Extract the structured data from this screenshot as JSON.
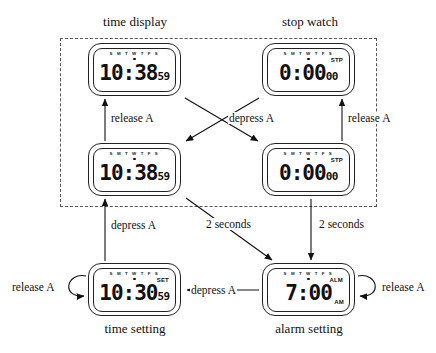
{
  "diagram": {
    "title_groups": [
      {
        "id": "time-display",
        "label": "time display"
      },
      {
        "id": "stop-watch",
        "label": "stop watch"
      }
    ],
    "bottom_captions": [
      {
        "id": "time-setting",
        "label": "time setting"
      },
      {
        "id": "alarm-setting",
        "label": "alarm setting"
      }
    ],
    "day_indicator": "S M T W T F S",
    "states": [
      {
        "id": "time-display-released",
        "group": "time display",
        "big": "10:38",
        "small": "59",
        "flag_top": "",
        "flag_bottom": ""
      },
      {
        "id": "stop-watch-released",
        "group": "stop watch",
        "big": "0:00",
        "small": "00",
        "flag_top": "STP",
        "flag_bottom": ""
      },
      {
        "id": "time-display-depressed",
        "group": "time display",
        "big": "10:38",
        "small": "59",
        "flag_top": "",
        "flag_bottom": ""
      },
      {
        "id": "stop-watch-depressed",
        "group": "stop watch",
        "big": "0:00",
        "small": "00",
        "flag_top": "STP",
        "flag_bottom": ""
      },
      {
        "id": "time-setting",
        "group": "time setting",
        "big": "10:30",
        "small": "59",
        "flag_top": "SET",
        "flag_bottom": ""
      },
      {
        "id": "alarm-setting",
        "group": "alarm setting",
        "big": "7:00",
        "small": "",
        "flag_top": "ALM",
        "flag_bottom": "AM"
      }
    ],
    "transitions": [
      {
        "id": "t1",
        "label": "release A"
      },
      {
        "id": "t2",
        "label": "depress A"
      },
      {
        "id": "t3",
        "label": "release A"
      },
      {
        "id": "t4",
        "label": "depress A"
      },
      {
        "id": "t5",
        "label": "2 seconds"
      },
      {
        "id": "t6",
        "label": "2 seconds"
      },
      {
        "id": "t7",
        "label": "release A"
      },
      {
        "id": "t8",
        "label": "depress A"
      },
      {
        "id": "t9",
        "label": "release A"
      }
    ]
  }
}
